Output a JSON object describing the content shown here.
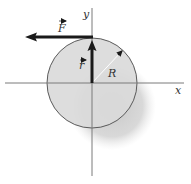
{
  "diagram": {
    "labels": {
      "force": "F",
      "position": "r",
      "radius": "R",
      "x_axis": "x",
      "y_axis": "y"
    },
    "colors": {
      "disk_fill": "#d9d9d9",
      "disk_stroke": "#555555",
      "shadow": "#cccccc",
      "axis": "#777777",
      "vector": "#1a1a1a",
      "radius_line": "#ffffff"
    },
    "geometry": {
      "center": [
        92,
        83
      ],
      "radius": 45,
      "shadow_center": [
        112,
        106
      ],
      "shadow_radius": 42,
      "force_start": [
        92,
        37
      ],
      "force_end": [
        25,
        37
      ],
      "r_start": [
        92,
        83
      ],
      "r_end": [
        92,
        41
      ],
      "R_end": [
        123,
        50
      ]
    }
  }
}
